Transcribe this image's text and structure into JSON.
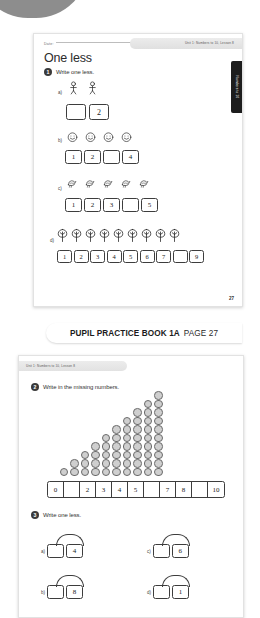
{
  "decor": {
    "blob": "gray-ellipse"
  },
  "page1": {
    "date_label": "Date:",
    "unit_tag": "Unit 1: Numbers to 10, Lesson 8",
    "side_tab": "Numbers to 10",
    "title": "One less",
    "page_number": "27",
    "q1": {
      "number": "1",
      "text": "Write one less.",
      "rows": [
        {
          "label": "a)",
          "icon": "stick-figure-icon",
          "icon_count": 2,
          "boxes": [
            "",
            "2"
          ]
        },
        {
          "label": "b)",
          "icon": "smiley-face-icon",
          "icon_count": 4,
          "boxes": [
            "1",
            "2",
            "",
            "4"
          ]
        },
        {
          "label": "c)",
          "icon": "bird-icon",
          "icon_count": 5,
          "boxes": [
            "1",
            "2",
            "3",
            "",
            "5"
          ]
        },
        {
          "label": "d)",
          "icon": "tree-icon",
          "icon_count": 9,
          "boxes": [
            "1",
            "2",
            "3",
            "4",
            "5",
            "6",
            "7",
            "",
            "9"
          ]
        }
      ]
    }
  },
  "caption": {
    "bold": "PUPIL PRACTICE BOOK 1A",
    "normal": "PAGE 27"
  },
  "page2": {
    "unit_tag": "Unit 1: Numbers to 10, Lesson 8",
    "q2": {
      "number": "2",
      "text": "Write in the missing numbers.",
      "track": [
        "0",
        "",
        "2",
        "3",
        "4",
        "5",
        "",
        "7",
        "8",
        "",
        "10"
      ]
    },
    "q3": {
      "number": "3",
      "text": "Write one less.",
      "pairs": [
        {
          "label": "a)",
          "left": "",
          "right": "4"
        },
        {
          "label": "c)",
          "left": "",
          "right": "6"
        },
        {
          "label": "b)",
          "left": "",
          "right": "8"
        },
        {
          "label": "d)",
          "left": "",
          "right": "1"
        }
      ]
    }
  },
  "chart_data": {
    "type": "bar",
    "categories": [
      "0",
      "1",
      "2",
      "3",
      "4",
      "5",
      "6",
      "7",
      "8",
      "9",
      "10"
    ],
    "values": [
      0,
      1,
      2,
      3,
      4,
      5,
      6,
      7,
      8,
      9,
      10
    ],
    "xlabel": "",
    "ylabel": "",
    "ylim": [
      0,
      10
    ],
    "grid": false,
    "legend": "none",
    "note": "Cube towers increasing by one; number track beneath has blanks at 1, 6 and 9"
  }
}
